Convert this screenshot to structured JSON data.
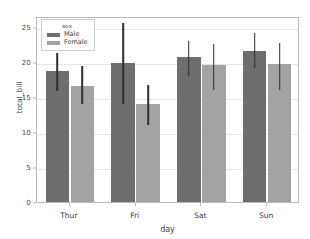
{
  "chart_data": {
    "type": "bar",
    "title": "",
    "xlabel": "day",
    "ylabel": "total_bill",
    "categories": [
      "Thur",
      "Fri",
      "Sat",
      "Sun"
    ],
    "ylim": [
      0,
      26.5
    ],
    "yticks": [
      0,
      5,
      10,
      15,
      20,
      25
    ],
    "ytick_labels": [
      "0",
      "5",
      "10",
      "15",
      "20",
      "25"
    ],
    "grid": "horizontal",
    "legend": {
      "title": "sex",
      "position": "upper left",
      "entries": [
        {
          "name": "Male",
          "color": "#6e6e6e"
        },
        {
          "name": "Female",
          "color": "#a3a3a3"
        }
      ]
    },
    "errorbar_color": "#2f2f2f",
    "series": [
      {
        "name": "Male",
        "color": "#6e6e6e",
        "values": [
          18.7,
          19.8,
          20.6,
          21.5
        ],
        "err_low": [
          16.1,
          14.3,
          18.2,
          19.4
        ],
        "err_high": [
          21.5,
          25.8,
          23.2,
          24.4
        ]
      },
      {
        "name": "Female",
        "color": "#a3a3a3",
        "values": [
          16.6,
          14.0,
          19.5,
          19.7
        ],
        "err_low": [
          14.2,
          11.2,
          16.3,
          16.3
        ],
        "err_high": [
          19.6,
          17.0,
          22.8,
          23.0
        ]
      }
    ]
  },
  "figure": {
    "background": "#ffffff",
    "axes_background": "#ffffff",
    "grid_color": "#e6e6e6",
    "frame_color": "#b9b9b9"
  }
}
